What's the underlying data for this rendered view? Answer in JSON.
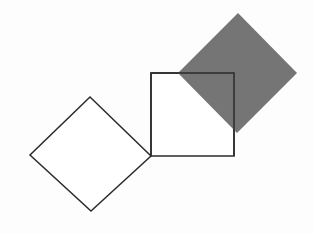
{
  "figure": {
    "width": 314,
    "height": 234,
    "background_color": "#fdfdfd",
    "stroke_color": "#2b2b2b",
    "stroke_width": 1.5,
    "shapes": [
      {
        "name": "white-diamond",
        "label": "Rotated white square (diamond) at left",
        "kind": "square-rotated-45",
        "fill": "#ffffff",
        "stroke": "#2b2b2b",
        "points": "90,97 151,156 91,211 30,155",
        "vertices": {
          "top": [
            90,
            97
          ],
          "right": [
            151,
            156
          ],
          "bottom": [
            91,
            211
          ],
          "left": [
            30,
            155
          ]
        },
        "side_length": 85,
        "z": 1
      },
      {
        "name": "white-square",
        "label": "Upright white square at center",
        "kind": "square-upright",
        "fill": "#ffffff",
        "stroke": "#2b2b2b",
        "points": "151,73 234,73 234,156 151,156",
        "vertices": {
          "top_left": [
            151,
            73
          ],
          "top_right": [
            234,
            73
          ],
          "bottom_right": [
            234,
            156
          ],
          "bottom_left": [
            151,
            156
          ]
        },
        "side_length": 83,
        "z": 2
      },
      {
        "name": "gray-diamond",
        "label": "Rotated gray square (diamond) at upper right",
        "kind": "square-rotated-45",
        "fill": "#757575",
        "stroke": "none",
        "points": "238,13 297,73 237,133 178,73",
        "vertices": {
          "top": [
            238,
            13
          ],
          "right": [
            297,
            73
          ],
          "bottom": [
            237,
            133
          ],
          "left": [
            178,
            73
          ]
        },
        "side_length": 84,
        "z": 3
      }
    ],
    "overlay_strokes": [
      {
        "name": "white-square-top-edge-overlay",
        "label": "Top edge of the white square redrawn above the gray diamond",
        "from": [
          151,
          73
        ],
        "to": [
          234,
          73
        ]
      },
      {
        "name": "white-square-right-edge-overlay",
        "label": "Right edge of the white square redrawn above the gray diamond",
        "from": [
          234,
          73
        ],
        "to": [
          234,
          156
        ]
      }
    ]
  }
}
